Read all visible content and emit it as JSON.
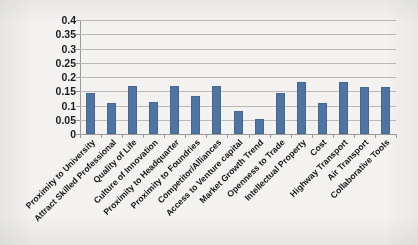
{
  "chart_data": {
    "type": "bar",
    "title": "",
    "xlabel": "",
    "ylabel": "",
    "ylim": [
      0,
      0.4
    ],
    "ytick_values": [
      0,
      0.05,
      0.1,
      0.15,
      0.2,
      0.25,
      0.3,
      0.35,
      0.4
    ],
    "ytick_labels": [
      "0",
      "0.05",
      "0.1",
      "0.15",
      "0.2",
      "0.25",
      "0.3",
      "0.35",
      "0.4"
    ],
    "grid": "horizontal",
    "legend": "none",
    "bar_color": "#4f74a3",
    "categories": [
      "Proximity to University",
      "Attract Skilled Professional",
      "Quality of Life",
      "Culture of Innovation",
      "Proximity to Headquarter",
      "Proximity to Foundries",
      "Competitor/Alliances",
      "Access to Venture capital",
      "Market Growth Trend",
      "Openness to Trade",
      "Intellectual Property",
      "Cost",
      "Highway Transport",
      "Air Transport",
      "Collaborative Tools"
    ],
    "values": [
      0.143,
      0.11,
      0.168,
      0.111,
      0.167,
      0.134,
      0.168,
      0.082,
      0.052,
      0.143,
      0.182,
      0.108,
      0.183,
      0.164,
      0.165
    ]
  }
}
